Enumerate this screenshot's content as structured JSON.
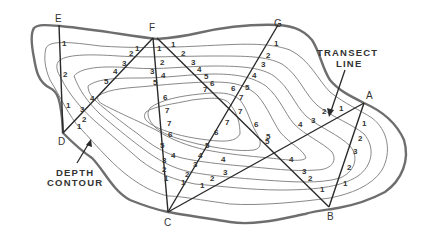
{
  "diagram": {
    "stations": [
      {
        "id": "E",
        "label": "E",
        "x": 59,
        "y": 22
      },
      {
        "id": "F",
        "label": "F",
        "x": 153,
        "y": 31
      },
      {
        "id": "G",
        "label": "G",
        "x": 278,
        "y": 27
      },
      {
        "id": "A",
        "label": "A",
        "x": 370,
        "y": 99
      },
      {
        "id": "B",
        "label": "B",
        "x": 331,
        "y": 220
      },
      {
        "id": "C",
        "label": "C",
        "x": 168,
        "y": 226
      },
      {
        "id": "D",
        "label": "D",
        "x": 62,
        "y": 145
      }
    ],
    "transects": [
      {
        "from": "E",
        "to": "D"
      },
      {
        "from": "D",
        "to": "F"
      },
      {
        "from": "F",
        "to": "C"
      },
      {
        "from": "F",
        "to": "B"
      },
      {
        "from": "G",
        "to": "C"
      },
      {
        "from": "C",
        "to": "A"
      },
      {
        "from": "A",
        "to": "B"
      }
    ],
    "callouts": {
      "transect_line": {
        "line1": "TRANSECT",
        "line2": "LINE"
      },
      "depth_contour": {
        "line1": "DEPTH",
        "line2": "CONTOUR"
      }
    },
    "depth_labels": [
      {
        "v": "1",
        "x": 62,
        "y": 46
      },
      {
        "v": "2",
        "x": 63,
        "y": 77
      },
      {
        "v": "1",
        "x": 66,
        "y": 108
      },
      {
        "v": "1",
        "x": 135,
        "y": 51
      },
      {
        "v": "2",
        "x": 129,
        "y": 56
      },
      {
        "v": "3",
        "x": 122,
        "y": 66
      },
      {
        "v": "4",
        "x": 113,
        "y": 74
      },
      {
        "v": "5",
        "x": 104,
        "y": 84
      },
      {
        "v": "4",
        "x": 90,
        "y": 101
      },
      {
        "v": "3",
        "x": 80,
        "y": 112
      },
      {
        "v": "2",
        "x": 82,
        "y": 122
      },
      {
        "v": "1",
        "x": 77,
        "y": 129
      },
      {
        "v": "1",
        "x": 157,
        "y": 51
      },
      {
        "v": "2",
        "x": 160,
        "y": 65
      },
      {
        "v": "3",
        "x": 150,
        "y": 74
      },
      {
        "v": "4",
        "x": 161,
        "y": 78
      },
      {
        "v": "5",
        "x": 153,
        "y": 85
      },
      {
        "v": "6",
        "x": 163,
        "y": 100
      },
      {
        "v": "7",
        "x": 165,
        "y": 113
      },
      {
        "v": "7",
        "x": 167,
        "y": 126
      },
      {
        "v": "6",
        "x": 168,
        "y": 137
      },
      {
        "v": "5",
        "x": 160,
        "y": 148
      },
      {
        "v": "4",
        "x": 171,
        "y": 158
      },
      {
        "v": "3",
        "x": 162,
        "y": 163
      },
      {
        "v": "2",
        "x": 162,
        "y": 172
      },
      {
        "v": "1",
        "x": 164,
        "y": 181
      },
      {
        "v": "1",
        "x": 171,
        "y": 47
      },
      {
        "v": "2",
        "x": 181,
        "y": 56
      },
      {
        "v": "3",
        "x": 191,
        "y": 65
      },
      {
        "v": "4",
        "x": 197,
        "y": 72
      },
      {
        "v": "5",
        "x": 204,
        "y": 79
      },
      {
        "v": "6",
        "x": 210,
        "y": 86
      },
      {
        "v": "7",
        "x": 203,
        "y": 92
      },
      {
        "v": "6",
        "x": 254,
        "y": 127
      },
      {
        "v": "5",
        "x": 265,
        "y": 144
      },
      {
        "v": "4",
        "x": 289,
        "y": 162
      },
      {
        "v": "3",
        "x": 302,
        "y": 174
      },
      {
        "v": "2",
        "x": 308,
        "y": 181
      },
      {
        "v": "1",
        "x": 320,
        "y": 192
      },
      {
        "v": "1",
        "x": 274,
        "y": 46
      },
      {
        "v": "2",
        "x": 266,
        "y": 58
      },
      {
        "v": "3",
        "x": 261,
        "y": 67
      },
      {
        "v": "4",
        "x": 252,
        "y": 78
      },
      {
        "v": "5",
        "x": 245,
        "y": 90
      },
      {
        "v": "6",
        "x": 231,
        "y": 91
      },
      {
        "v": "7",
        "x": 239,
        "y": 100
      },
      {
        "v": "7",
        "x": 238,
        "y": 114
      },
      {
        "v": "7",
        "x": 225,
        "y": 125
      },
      {
        "v": "6",
        "x": 214,
        "y": 135
      },
      {
        "v": "5",
        "x": 205,
        "y": 148
      },
      {
        "v": "4",
        "x": 198,
        "y": 158
      },
      {
        "v": "3",
        "x": 193,
        "y": 167
      },
      {
        "v": "2",
        "x": 185,
        "y": 177
      },
      {
        "v": "1",
        "x": 181,
        "y": 185
      },
      {
        "v": "1",
        "x": 200,
        "y": 188
      },
      {
        "v": "2",
        "x": 210,
        "y": 181
      },
      {
        "v": "3",
        "x": 223,
        "y": 175
      },
      {
        "v": "4",
        "x": 221,
        "y": 162
      },
      {
        "v": "5",
        "x": 266,
        "y": 139
      },
      {
        "v": "4",
        "x": 298,
        "y": 127
      },
      {
        "v": "3",
        "x": 311,
        "y": 123
      },
      {
        "v": "2",
        "x": 322,
        "y": 114
      },
      {
        "v": "1",
        "x": 339,
        "y": 111
      },
      {
        "v": "1",
        "x": 362,
        "y": 126
      },
      {
        "v": "2",
        "x": 358,
        "y": 141
      },
      {
        "v": "3",
        "x": 353,
        "y": 154
      },
      {
        "v": "2",
        "x": 347,
        "y": 170
      },
      {
        "v": "1",
        "x": 343,
        "y": 186
      }
    ]
  }
}
